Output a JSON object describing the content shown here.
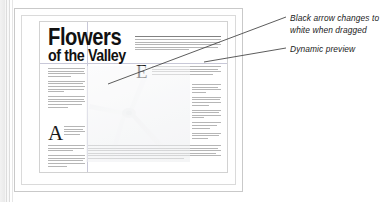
{
  "app": {
    "window_chrome": "left-scroll-rule"
  },
  "document": {
    "masthead": {
      "line1": "Flowers",
      "line2": "of the Valley"
    },
    "dropcaps": {
      "left_column": "A",
      "right_column": "E"
    },
    "preview": {
      "name": "wind-turbine-photo",
      "state": "dynamic-preview-while-dragging"
    },
    "guides": {
      "vertical_guide": "column-guide",
      "horizontal_guide": "margin-guide"
    }
  },
  "annotations": [
    {
      "id": "annotation-black-arrow",
      "text": "Black arrow changes to\nwhite when dragged",
      "leader": "line-to-pointer"
    },
    {
      "id": "annotation-dynamic-preview",
      "text": "Dynamic preview",
      "leader": "line-to-preview"
    }
  ],
  "colors": {
    "page_background": "#ffffff",
    "frame_border": "#c9c9c9",
    "guide": "#c8c8d8",
    "leader_line": "#4a4a4a",
    "text": "#1b1b1b",
    "greek_text": "#9a9a9a"
  }
}
